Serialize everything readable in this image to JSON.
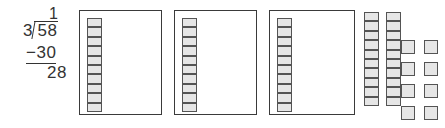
{
  "problem": {
    "type": "long-division",
    "quotient": "1",
    "divisor": "3",
    "dividend": "58",
    "subtrahend": "−30",
    "remainder": "28"
  },
  "model": {
    "description": "base-ten blocks grouping model",
    "box_count": 3,
    "boxes": [
      {
        "label": "group-1",
        "rod_units": 10
      },
      {
        "label": "group-2",
        "rod_units": 10
      },
      {
        "label": "group-3",
        "rod_units": 10
      }
    ],
    "loose_rods": [
      {
        "label": "rod-1",
        "rod_units": 10
      },
      {
        "label": "rod-2",
        "rod_units": 10
      }
    ],
    "loose_units": 8,
    "loose_units_columns": 2,
    "loose_units_rows": 4
  },
  "colors": {
    "ink": "#333333",
    "box_border": "#3a3a3a",
    "unit_border": "#545454",
    "unit_fill": "#e6e6e6",
    "background": "#ffffff"
  }
}
